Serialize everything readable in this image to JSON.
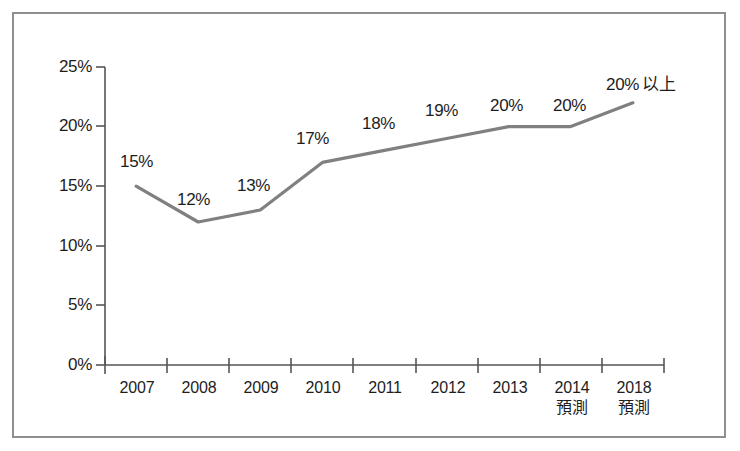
{
  "chart_data": {
    "type": "line",
    "title": "",
    "subtitle": "",
    "xlabel": "",
    "ylabel": "",
    "categories": [
      "2007",
      "2008",
      "2009",
      "2010",
      "2011",
      "2012",
      "2013",
      "2014",
      "2018"
    ],
    "category_notes": [
      "",
      "",
      "",
      "",
      "",
      "",
      "",
      "預測",
      "預測"
    ],
    "values": [
      15,
      12,
      13,
      17,
      18,
      19,
      20,
      20,
      22
    ],
    "point_labels": [
      "15%",
      "12%",
      "13%",
      "17%",
      "18%",
      "19%",
      "20%",
      "20%",
      "20%"
    ],
    "last_point_suffix": "以上",
    "ylim": [
      0,
      25
    ],
    "ytick_values": [
      0,
      5,
      10,
      15,
      20,
      25
    ],
    "ytick_labels": [
      "0%",
      "5%",
      "10%",
      "15%",
      "20%",
      "25%"
    ],
    "grid": false,
    "legend": "none",
    "series": [
      {
        "name": "",
        "values": [
          15,
          12,
          13,
          17,
          18,
          19,
          20,
          20,
          22
        ]
      }
    ],
    "colors": {
      "line": "#808080",
      "axis": "#555555",
      "text": "#1d1d1d",
      "frame": "#8f8f8f",
      "background": "#ffffff"
    }
  }
}
